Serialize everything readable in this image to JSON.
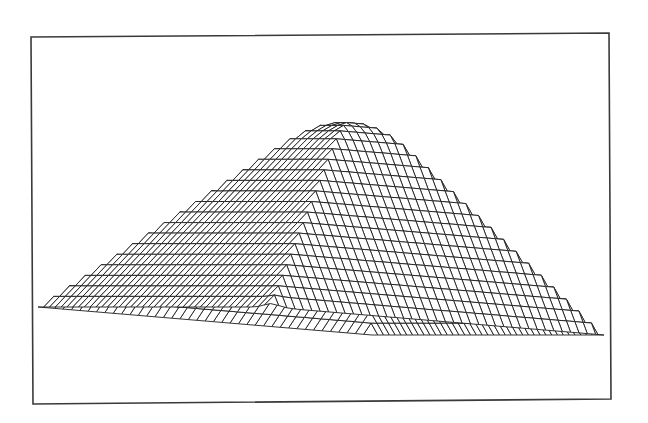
{
  "chart_data": {
    "type": "surface-wireframe",
    "title": "",
    "xlabel": "",
    "ylabel": "",
    "zlabel": "",
    "legend": [],
    "axes_visible": false,
    "grid": false,
    "grid_resolution": {
      "u": 40,
      "v": 40
    },
    "surface": {
      "shape": "pyramid",
      "peak_height": 1.0,
      "base_height": 0.0,
      "apex_rounding": 0.06,
      "front_corner_bump": {
        "u": 0.0,
        "v": 0.0,
        "height": 0.015
      }
    },
    "projection_px": {
      "base_left": [
        38,
        307
      ],
      "base_front": [
        270,
        307
      ],
      "base_right": [
        604,
        335
      ],
      "apex": [
        353,
        96
      ]
    },
    "colors": {
      "line": "#1e1e1e",
      "frame": "#3a3a3a",
      "background": "#ffffff",
      "face_fill": "#ffffff"
    }
  },
  "frame": {
    "x1": 31,
    "y1": 36,
    "x2": 610,
    "y2": 401
  }
}
